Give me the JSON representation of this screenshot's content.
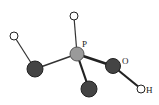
{
  "diagram": {
    "type": "ball-and-stick molecule",
    "colors": {
      "central_atom": "#9a9a9a",
      "dark_atom": "#444444",
      "hydrogen_fill": "#ffffff",
      "bond": "#333333",
      "outline": "#222222"
    },
    "labels": {
      "phosphorus": "P",
      "oxygen": "O",
      "hydroxyl_h": "H"
    },
    "atoms": [
      {
        "id": "top-h",
        "kind": "hydrogen"
      },
      {
        "id": "phosphorus",
        "kind": "central",
        "label": "P"
      },
      {
        "id": "left-h",
        "kind": "hydrogen"
      },
      {
        "id": "left-dark",
        "kind": "dark"
      },
      {
        "id": "bottom-dark",
        "kind": "dark"
      },
      {
        "id": "oxygen",
        "kind": "dark",
        "label": "O"
      },
      {
        "id": "oh-h",
        "kind": "hydrogen",
        "label": "H"
      }
    ]
  }
}
